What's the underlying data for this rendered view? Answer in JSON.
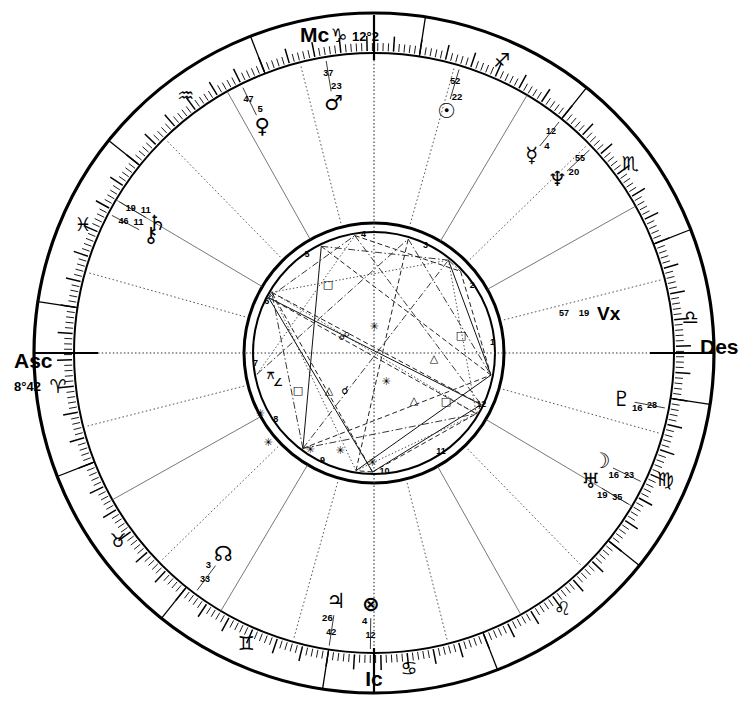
{
  "chart": {
    "type": "astrological-natal-wheel",
    "radii": {
      "outer": 340,
      "sign_inner": 300,
      "house_ring": 210,
      "aspect_outer": 130,
      "aspect_inner": 121
    },
    "center": {
      "x": 374,
      "y": 353
    }
  },
  "axes": [
    {
      "key": "mc",
      "label": "Mc",
      "degree": "12°2",
      "position": "top"
    },
    {
      "key": "asc",
      "label": "Asc",
      "degree": "8°42",
      "position": "left"
    },
    {
      "key": "des",
      "label": "Des",
      "degree": "",
      "position": "right"
    },
    {
      "key": "ic",
      "label": "Ic",
      "degree": "",
      "position": "bottom"
    }
  ],
  "vertex": {
    "label": "Vx",
    "deg": "19",
    "min": "57",
    "sign": "aries"
  },
  "zodiac_signs": [
    {
      "name": "aries",
      "glyph": "♈",
      "angle_deg": 8.7
    },
    {
      "name": "taurus",
      "glyph": "♉",
      "angle_deg": 38.7
    },
    {
      "name": "gemini",
      "glyph": "♊",
      "angle_deg": 68.7
    },
    {
      "name": "cancer",
      "glyph": "♋",
      "angle_deg": 98.7
    },
    {
      "name": "leo",
      "glyph": "♌",
      "angle_deg": 128.7
    },
    {
      "name": "virgo",
      "glyph": "♍",
      "angle_deg": 158.7
    },
    {
      "name": "libra",
      "glyph": "♎",
      "angle_deg": 188.7
    },
    {
      "name": "scorpio",
      "glyph": "♏",
      "angle_deg": 218.7
    },
    {
      "name": "sagittarius",
      "glyph": "♐",
      "angle_deg": 248.7
    },
    {
      "name": "capricorn",
      "glyph": "♑",
      "angle_deg": 278.7
    },
    {
      "name": "aquarius",
      "glyph": "♒",
      "angle_deg": 308.7
    },
    {
      "name": "pisces",
      "glyph": "♓",
      "angle_deg": 338.7
    }
  ],
  "planets": [
    {
      "name": "part-of-fortune",
      "glyph": "⊗",
      "deg": "4",
      "min": "12",
      "zodiac_lon": 98.0,
      "place": "upper-center-left"
    },
    {
      "name": "jupiter",
      "glyph": "♃",
      "deg": "26",
      "min": "42",
      "zodiac_lon": 90.0,
      "place": "upper-center"
    },
    {
      "name": "north-node",
      "glyph": "☊",
      "deg": "3",
      "min": "33",
      "zodiac_lon": 62.0,
      "place": "upper-right"
    },
    {
      "name": "vertex",
      "glyph": "Vx",
      "deg": "19",
      "min": "57",
      "zodiac_lon": 19.0,
      "place": "right"
    },
    {
      "name": "chiron",
      "glyph": "⚷",
      "deg": "11",
      "min": "46",
      "zodiac_lon": 341.0,
      "place": "lower-right"
    },
    {
      "name": "saturn",
      "glyph": "♄",
      "deg": "11",
      "min": "19",
      "zodiac_lon": 338.0,
      "place": "lower-right"
    },
    {
      "name": "venus",
      "glyph": "♀",
      "deg": "5",
      "min": "47",
      "zodiac_lon": 305.0,
      "place": "bottom-right"
    },
    {
      "name": "mars",
      "glyph": "♂",
      "deg": "23",
      "min": "37",
      "zodiac_lon": 288.0,
      "place": "bottom-center-right"
    },
    {
      "name": "sun",
      "glyph": "☉",
      "deg": "22",
      "min": "52",
      "zodiac_lon": 262.0,
      "place": "bottom-center-left"
    },
    {
      "name": "mercury",
      "glyph": "☿",
      "deg": "4",
      "min": "12",
      "zodiac_lon": 240.0,
      "place": "bottom-left"
    },
    {
      "name": "neptune",
      "glyph": "♆",
      "deg": "20",
      "min": "55",
      "zodiac_lon": 232.0,
      "place": "bottom-left"
    },
    {
      "name": "pluto",
      "glyph": "♇",
      "deg": "16",
      "min": "28",
      "zodiac_lon": 178.0,
      "place": "left-upper"
    },
    {
      "name": "moon",
      "glyph": "☽",
      "deg": "16",
      "min": "23",
      "zodiac_lon": 163.0,
      "place": "left-upper"
    },
    {
      "name": "uranus",
      "glyph": "♅",
      "deg": "19",
      "min": "35",
      "zodiac_lon": 158.0,
      "place": "left-upper"
    }
  ],
  "house_numbers": [
    "1",
    "2",
    "3",
    "4",
    "5",
    "6",
    "7",
    "8",
    "9",
    "10",
    "11",
    "12"
  ],
  "aspect_glyphs": [
    {
      "name": "square",
      "glyph": "□",
      "x": 328,
      "y": 285
    },
    {
      "name": "sextile",
      "glyph": "✳",
      "x": 374,
      "y": 327
    },
    {
      "name": "opposition",
      "glyph": "☍",
      "x": 344,
      "y": 337
    },
    {
      "name": "square",
      "glyph": "□",
      "x": 461,
      "y": 336
    },
    {
      "name": "trine",
      "glyph": "△",
      "x": 434,
      "y": 359
    },
    {
      "name": "sextile",
      "glyph": "✳",
      "x": 386,
      "y": 382
    },
    {
      "name": "trine",
      "glyph": "△",
      "x": 414,
      "y": 401
    },
    {
      "name": "square",
      "glyph": "□",
      "x": 446,
      "y": 402
    },
    {
      "name": "square",
      "glyph": "□",
      "x": 298,
      "y": 391
    },
    {
      "name": "trine",
      "glyph": "△",
      "x": 329,
      "y": 391
    },
    {
      "name": "conjunction",
      "glyph": "☌",
      "x": 345,
      "y": 391
    },
    {
      "name": "quincunx",
      "glyph": "⚻",
      "x": 270,
      "y": 376
    },
    {
      "name": "semisquare",
      "glyph": "∠",
      "x": 278,
      "y": 383
    },
    {
      "name": "sextile",
      "glyph": "✳",
      "x": 268,
      "y": 443
    },
    {
      "name": "sextile",
      "glyph": "✳",
      "x": 310,
      "y": 450
    },
    {
      "name": "sextile",
      "glyph": "✳",
      "x": 340,
      "y": 451
    },
    {
      "name": "sextile",
      "glyph": "✳",
      "x": 372,
      "y": 463
    },
    {
      "name": "sextile",
      "glyph": "✳",
      "x": 260,
      "y": 414
    }
  ],
  "colors": {
    "ink": "#000000",
    "background": "#ffffff",
    "aspect_line": "#222222",
    "house_line": "#555555"
  }
}
